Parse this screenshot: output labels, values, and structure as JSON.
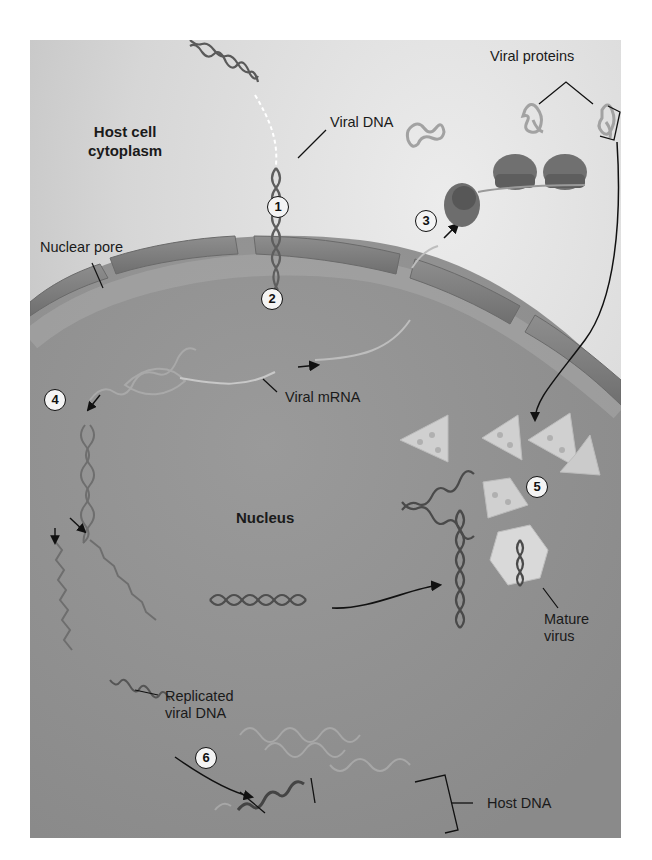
{
  "diagram": {
    "regions": {
      "cytoplasm": "Host cell\ncytoplasm",
      "nucleus": "Nucleus"
    },
    "labels": {
      "viral_dna": "Viral DNA",
      "nuclear_pore": "Nuclear pore",
      "viral_proteins": "Viral proteins",
      "viral_mrna": "Viral mRNA",
      "mature_virus": "Mature\nvirus",
      "replicated_viral_dna": "Replicated\nviral DNA",
      "host_dna": "Host DNA"
    },
    "steps": [
      {
        "number": "1",
        "meaning": "Viral DNA enters nucleus through nuclear pore"
      },
      {
        "number": "2",
        "meaning": "Viral DNA transcribed into viral mRNA"
      },
      {
        "number": "3",
        "meaning": "Ribosomes translate mRNA into viral proteins"
      },
      {
        "number": "4",
        "meaning": "Viral DNA replicated"
      },
      {
        "number": "5",
        "meaning": "Capsid proteins assemble around viral DNA forming mature virus"
      },
      {
        "number": "6",
        "meaning": "Replicated viral DNA integrates into host DNA"
      }
    ],
    "colors": {
      "cytoplasm": "#d2d2d2",
      "nucleus": "#8f8f8f",
      "envelope": "#7d7d7d",
      "dna": "#4a4a4a",
      "capsid": "#c8c8c8",
      "ink": "#1a1a1a"
    }
  }
}
